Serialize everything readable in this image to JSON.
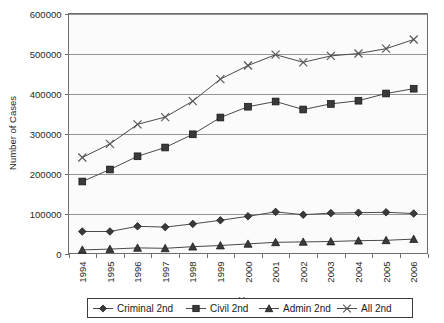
{
  "chart_data": {
    "type": "line",
    "title": "",
    "xlabel": "Year",
    "ylabel": "Number of Cases",
    "x": [
      1994,
      1995,
      1996,
      1997,
      1998,
      1999,
      2000,
      2001,
      2002,
      2003,
      2004,
      2005,
      2006
    ],
    "categories": [
      "1994",
      "1995",
      "1996",
      "1997",
      "1998",
      "1999",
      "2000",
      "2001",
      "2002",
      "2003",
      "2004",
      "2005",
      "2006"
    ],
    "ylim": [
      0,
      600000
    ],
    "yticks": [
      0,
      100000,
      200000,
      300000,
      400000,
      500000,
      600000
    ],
    "ytick_labels": [
      "0",
      "100000",
      "200000",
      "300000",
      "400000",
      "500000",
      "600000"
    ],
    "grid": true,
    "legend_position": "bottom",
    "series": [
      {
        "name": "Criminal 2nd",
        "marker": "diamond",
        "values": [
          55000,
          55000,
          68000,
          66000,
          74000,
          83000,
          93000,
          104000,
          97000,
          101000,
          102000,
          103000,
          100000
        ]
      },
      {
        "name": "Civil 2nd",
        "marker": "square",
        "values": [
          180000,
          210000,
          243000,
          265000,
          298000,
          340000,
          367000,
          380000,
          360000,
          374000,
          382000,
          400000,
          412000
        ]
      },
      {
        "name": "Admin 2nd",
        "marker": "triangle",
        "values": [
          9000,
          11000,
          14000,
          13000,
          17000,
          20000,
          24000,
          28000,
          29000,
          30000,
          32000,
          33000,
          36000
        ]
      },
      {
        "name": "All 2nd",
        "marker": "x",
        "values": [
          240000,
          274000,
          323000,
          341000,
          381000,
          436000,
          470000,
          497000,
          478000,
          494000,
          500000,
          512000,
          535000
        ]
      }
    ]
  },
  "axes": {
    "y_label": "Number of Cases",
    "x_label": "Year"
  },
  "legend": {
    "items": [
      {
        "label": "Criminal 2nd",
        "marker": "diamond-marker-icon"
      },
      {
        "label": "Civil 2nd",
        "marker": "square-marker-icon"
      },
      {
        "label": "Admin 2nd",
        "marker": "triangle-marker-icon"
      },
      {
        "label": "All 2nd",
        "marker": "x-marker-icon"
      }
    ]
  },
  "colors": {
    "plot_background": "#fbfbfb",
    "grid": "#8a8a8a",
    "axis": "#6e6e6e",
    "series_line": "#4a4a4a",
    "marker_fill": "#3a3a3a",
    "page_background": "#ffffff"
  }
}
